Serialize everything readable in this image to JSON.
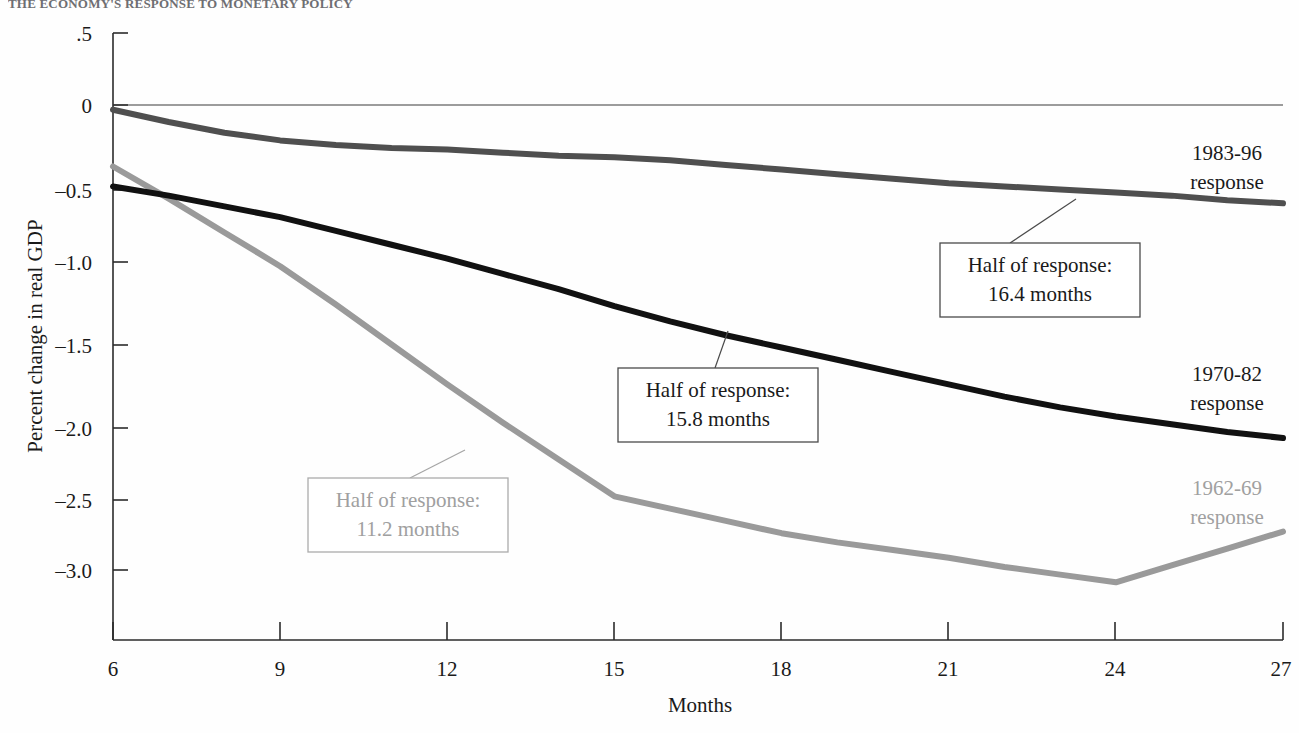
{
  "cropped_title": "THE ECONOMY'S RESPONSE TO MONETARY POLICY",
  "chart_data": {
    "type": "line",
    "title": "",
    "xlabel": "Months",
    "ylabel": "Percent change in real GDP",
    "xlim": [
      6,
      27
    ],
    "ylim": [
      -3.35,
      0.5
    ],
    "grid": false,
    "legend_position": "right-inline",
    "xticks": [
      "6",
      "9",
      "12",
      "15",
      "18",
      "21",
      "24",
      "27"
    ],
    "xtick_values": [
      6,
      9,
      12,
      15,
      18,
      21,
      24,
      27
    ],
    "yticks": [
      ".5",
      "0",
      "–0.5",
      "–1.0",
      "–1.5",
      "–2.0",
      "–2.5",
      "–3.0"
    ],
    "ytick_values": [
      0.5,
      0,
      -0.5,
      -1.0,
      -1.5,
      -2.0,
      -2.5,
      -3.0
    ],
    "zero_reference_line": 0,
    "series": [
      {
        "name": "1983-96 response",
        "color": "#4f4f4f",
        "label_line1": "1983-96",
        "label_line2": "response",
        "x": [
          6,
          7,
          8,
          9,
          10,
          11,
          12,
          13,
          14,
          15,
          16,
          17,
          18,
          19,
          20,
          21,
          22,
          23,
          24,
          25,
          26,
          27
        ],
        "y": [
          0.0,
          -0.08,
          -0.15,
          -0.2,
          -0.23,
          -0.25,
          -0.26,
          -0.28,
          -0.3,
          -0.31,
          -0.33,
          -0.36,
          -0.39,
          -0.42,
          -0.45,
          -0.48,
          -0.5,
          -0.52,
          -0.54,
          -0.56,
          -0.59,
          -0.61
        ]
      },
      {
        "name": "1970-82 response",
        "color": "#111111",
        "label_line1": "1970-82",
        "label_line2": "response",
        "x": [
          6,
          7,
          8,
          9,
          10,
          11,
          12,
          13,
          14,
          15,
          16,
          17,
          18,
          19,
          20,
          21,
          22,
          23,
          24,
          25,
          26,
          27
        ],
        "y": [
          -0.5,
          -0.56,
          -0.63,
          -0.7,
          -0.79,
          -0.88,
          -0.97,
          -1.07,
          -1.17,
          -1.28,
          -1.38,
          -1.47,
          -1.55,
          -1.63,
          -1.71,
          -1.79,
          -1.87,
          -1.94,
          -2.0,
          -2.05,
          -2.1,
          -2.14
        ]
      },
      {
        "name": "1962-69 response",
        "color": "#9a9a9a",
        "label_line1": "1962-69",
        "label_line2": "response",
        "x": [
          6,
          7,
          8,
          9,
          10,
          11,
          12,
          13,
          14,
          15,
          16,
          17,
          18,
          19,
          20,
          21,
          22,
          23,
          24,
          25,
          26,
          27
        ],
        "y": [
          -0.37,
          -0.58,
          -0.8,
          -1.02,
          -1.27,
          -1.53,
          -1.79,
          -2.04,
          -2.28,
          -2.52,
          -2.6,
          -2.68,
          -2.76,
          -2.82,
          -2.87,
          -2.92,
          -2.98,
          -3.03,
          -3.08,
          -2.97,
          -2.86,
          -2.75
        ]
      }
    ],
    "annotations": [
      {
        "id": "half-response-1983",
        "line1": "Half of response:",
        "line2": "16.4 months",
        "color": "#1a1a1a",
        "anchor_x": 22.6,
        "anchor_y": -0.53
      },
      {
        "id": "half-response-1970",
        "line1": "Half of response:",
        "line2": "15.8  months",
        "color": "#1a1a1a",
        "anchor_x": 15.2,
        "anchor_y": -1.43
      },
      {
        "id": "half-response-1962",
        "line1": "Half of response:",
        "line2": "11.2 months",
        "color": "#a0a0a0",
        "anchor_x": 11.3,
        "anchor_y": -1.81
      }
    ]
  }
}
